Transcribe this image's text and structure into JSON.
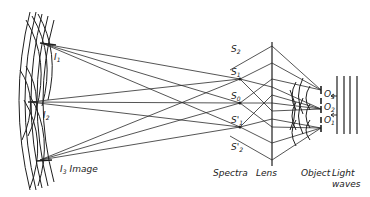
{
  "diagram": {
    "type": "optics-image-formation",
    "labels": {
      "I1": "I",
      "I1_sub": "1",
      "I2": "I",
      "I2_sub": "2",
      "I3": "I",
      "I3_sub": "3",
      "image": "Image",
      "S2": "S",
      "S2_sub": "2",
      "S1": "S",
      "S1_sub": "1",
      "S0": "S",
      "S0_sub": "0",
      "S1p": "S'",
      "S1p_sub": "1",
      "S2p": "S'",
      "S2p_sub": "2",
      "O3": "O",
      "O3_sub": "3",
      "O2": "O",
      "O2_sub": "2",
      "O1": "O",
      "O1_sub": "1",
      "spectra": "Spectra",
      "lens": "Lens",
      "object": "Object",
      "light": "Light",
      "waves": "waves"
    },
    "colors": {
      "line": "#1e1e1e",
      "background": "#ffffff"
    }
  }
}
